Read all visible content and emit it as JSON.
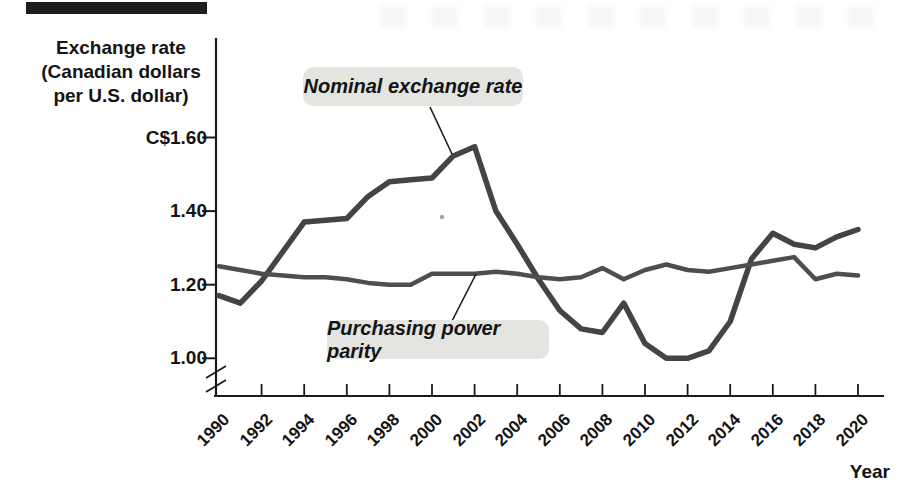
{
  "axis_titles": {
    "y_line1": "Exchange rate",
    "y_line2": "(Canadian dollars",
    "y_line3": "per U.S. dollar)",
    "x": "Year"
  },
  "annotations": {
    "nominal": "Nominal exchange rate",
    "ppp": "Purchasing power parity"
  },
  "style": {
    "axis_color": "#1a1a1a",
    "pill_background": "#e4e4e1",
    "top_bar_color": "#1d1d1d"
  },
  "chart_data": {
    "type": "line",
    "title": "",
    "xlabel": "Year",
    "ylabel": "Exchange rate (Canadian dollars per U.S. dollar)",
    "ylim": [
      1.0,
      1.6
    ],
    "axis_break_below_y": 1.0,
    "grid": false,
    "legend": "inline-annotation-labels",
    "x": [
      1990,
      1991,
      1992,
      1993,
      1994,
      1995,
      1996,
      1997,
      1998,
      1999,
      2000,
      2001,
      2002,
      2003,
      2004,
      2005,
      2006,
      2007,
      2008,
      2009,
      2010,
      2011,
      2012,
      2013,
      2014,
      2015,
      2016,
      2017,
      2018,
      2019,
      2020
    ],
    "x_tick_years": [
      1990,
      1992,
      1994,
      1996,
      1998,
      2000,
      2002,
      2004,
      2006,
      2008,
      2010,
      2012,
      2014,
      2016,
      2018,
      2020
    ],
    "y_ticks": [
      {
        "label": "C$1.60",
        "value": 1.6
      },
      {
        "label": "1.40",
        "value": 1.4
      },
      {
        "label": "1.20",
        "value": 1.2
      },
      {
        "label": "1.00",
        "value": 1.0
      }
    ],
    "series": [
      {
        "name": "Nominal exchange rate",
        "color": "#444446",
        "stroke_width": 5.5,
        "values": [
          1.17,
          1.15,
          1.21,
          1.29,
          1.37,
          1.375,
          1.38,
          1.44,
          1.48,
          1.485,
          1.49,
          1.55,
          1.575,
          1.4,
          1.31,
          1.215,
          1.13,
          1.08,
          1.07,
          1.15,
          1.04,
          1.0,
          1.0,
          1.02,
          1.1,
          1.27,
          1.34,
          1.31,
          1.3,
          1.33,
          1.35
        ]
      },
      {
        "name": "Purchasing power parity",
        "color": "#4e4e50",
        "stroke_width": 4.5,
        "values": [
          1.25,
          1.24,
          1.23,
          1.225,
          1.22,
          1.22,
          1.215,
          1.205,
          1.2,
          1.2,
          1.23,
          1.23,
          1.23,
          1.235,
          1.23,
          1.22,
          1.215,
          1.22,
          1.245,
          1.215,
          1.24,
          1.255,
          1.24,
          1.235,
          1.245,
          1.255,
          1.265,
          1.275,
          1.215,
          1.23,
          1.225
        ]
      }
    ]
  }
}
